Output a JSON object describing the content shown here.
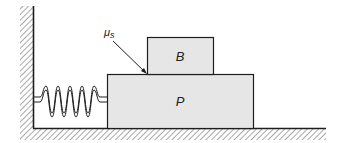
{
  "diagram": {
    "type": "physics-free-body-setup",
    "labels": {
      "block_top": "B",
      "block_bottom": "P",
      "friction_mu": "μ",
      "friction_sub": "s"
    },
    "elements": [
      "wall",
      "floor",
      "spring",
      "block P",
      "block B",
      "friction coefficient leader"
    ],
    "colors": {
      "block_fill": "#e6e6e6",
      "stroke": "#1e1e1e",
      "hatch": "#777777",
      "background": "#ffffff"
    }
  }
}
